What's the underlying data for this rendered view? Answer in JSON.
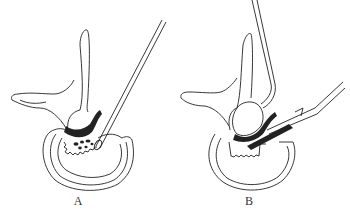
{
  "figure": {
    "panels": [
      {
        "label": "A",
        "description": "Vertebra cross-section with probe instrument removing disc fragments"
      },
      {
        "label": "B",
        "description": "Vertebra cross-section with retractor and forceps instrument"
      }
    ],
    "colors": {
      "ink": "#222222",
      "background": "#ffffff"
    }
  }
}
